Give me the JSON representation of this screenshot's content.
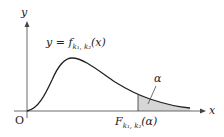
{
  "diagram": {
    "type": "probability-density-curve",
    "axes": {
      "x_label": "x",
      "y_label": "y",
      "origin_label": "O"
    },
    "curve_label": {
      "prefix": "y = f",
      "sub": "k₁, k₂",
      "suffix": "(x)"
    },
    "critical_value_label": {
      "prefix": "F",
      "sub": "k₁, k₂",
      "suffix": "(α)"
    },
    "area_label": "α",
    "colors": {
      "curve": "#222222",
      "axis": "#444444",
      "shade": "#d6d6d6"
    }
  }
}
